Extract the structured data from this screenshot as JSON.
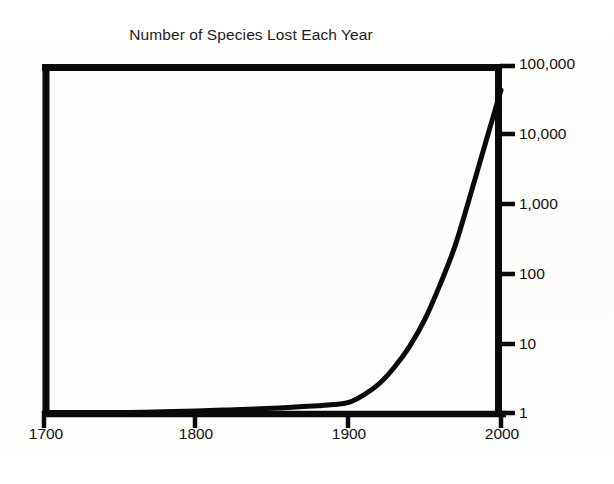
{
  "figure": {
    "width": 614,
    "height": 484,
    "background_color": "#fdfdfc",
    "ink_color": "#000000"
  },
  "chart_data": {
    "type": "line",
    "title": "Number of Species Lost Each Year",
    "subtitle": "",
    "xlabel": "",
    "ylabel": "",
    "yscale": "log",
    "xscale": "linear",
    "grid": false,
    "legend": null,
    "legend_position": "none",
    "xlim": [
      1700,
      2000
    ],
    "ylim": [
      1,
      100000
    ],
    "x_ticks": [
      1700,
      1800,
      1900,
      2000
    ],
    "x_tick_labels": [
      "1700",
      "1800",
      "1900",
      "2000"
    ],
    "y_ticks": [
      1,
      10,
      100,
      1000,
      10000,
      100000
    ],
    "y_tick_labels": [
      "1",
      "10",
      "100",
      "1,000",
      "10,000",
      "100,000"
    ],
    "y_axis_side": "right",
    "series": [
      {
        "name": "Species lost per year",
        "x": [
          1700,
          1750,
          1800,
          1825,
          1850,
          1865,
          1880,
          1890,
          1900,
          1910,
          1920,
          1930,
          1940,
          1950,
          1960,
          1970,
          1980,
          1990,
          2000
        ],
        "values": [
          1.0,
          1.0,
          1.05,
          1.1,
          1.15,
          1.2,
          1.25,
          1.3,
          1.4,
          1.8,
          2.6,
          4.5,
          9,
          22,
          70,
          260,
          1400,
          8000,
          45000
        ]
      }
    ],
    "annotations": []
  },
  "axis": {
    "frame": {
      "left_px": 42,
      "right_px": 502,
      "top_px": 64,
      "bottom_px": 414
    }
  }
}
